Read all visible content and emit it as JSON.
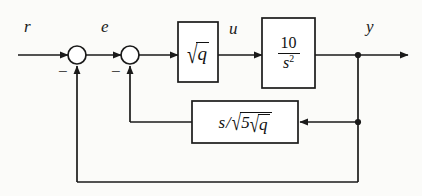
{
  "diagram": {
    "type": "control-system-block-diagram",
    "background_color": "#fbfbf9",
    "line_color": "#1a1a1a",
    "signals": {
      "reference": "r",
      "error": "e",
      "control": "u",
      "output": "y"
    },
    "summing_junctions": [
      {
        "name": "outer-sum",
        "plus_input": "r",
        "minus_sign": "−",
        "output": "e"
      },
      {
        "name": "inner-sum",
        "plus_input": "e",
        "minus_sign": "−",
        "output": "controller input"
      }
    ],
    "blocks": [
      {
        "name": "gain-block",
        "expression": "sqrt(q)",
        "radicand": "q",
        "radical_glyph": "√"
      },
      {
        "name": "plant-block",
        "expression": "10/s^2",
        "numerator": "10",
        "denominator_base": "s",
        "denominator_exponent": "2"
      },
      {
        "name": "rate-feedback-block",
        "expression": "s/sqrt(5 sqrt(q))",
        "numerator": "s",
        "divider": "/",
        "outer_radical_glyph": "√",
        "outer_coefficient": "5",
        "inner_radical_glyph": "√",
        "inner_radicand": "q"
      }
    ],
    "paths": [
      {
        "name": "forward-path",
        "from": "r",
        "to": "y"
      },
      {
        "name": "inner-feedback-path",
        "from": "y",
        "to": "inner-sum",
        "through": "rate-feedback-block"
      },
      {
        "name": "outer-feedback-path",
        "from": "y",
        "to": "outer-sum"
      }
    ]
  }
}
